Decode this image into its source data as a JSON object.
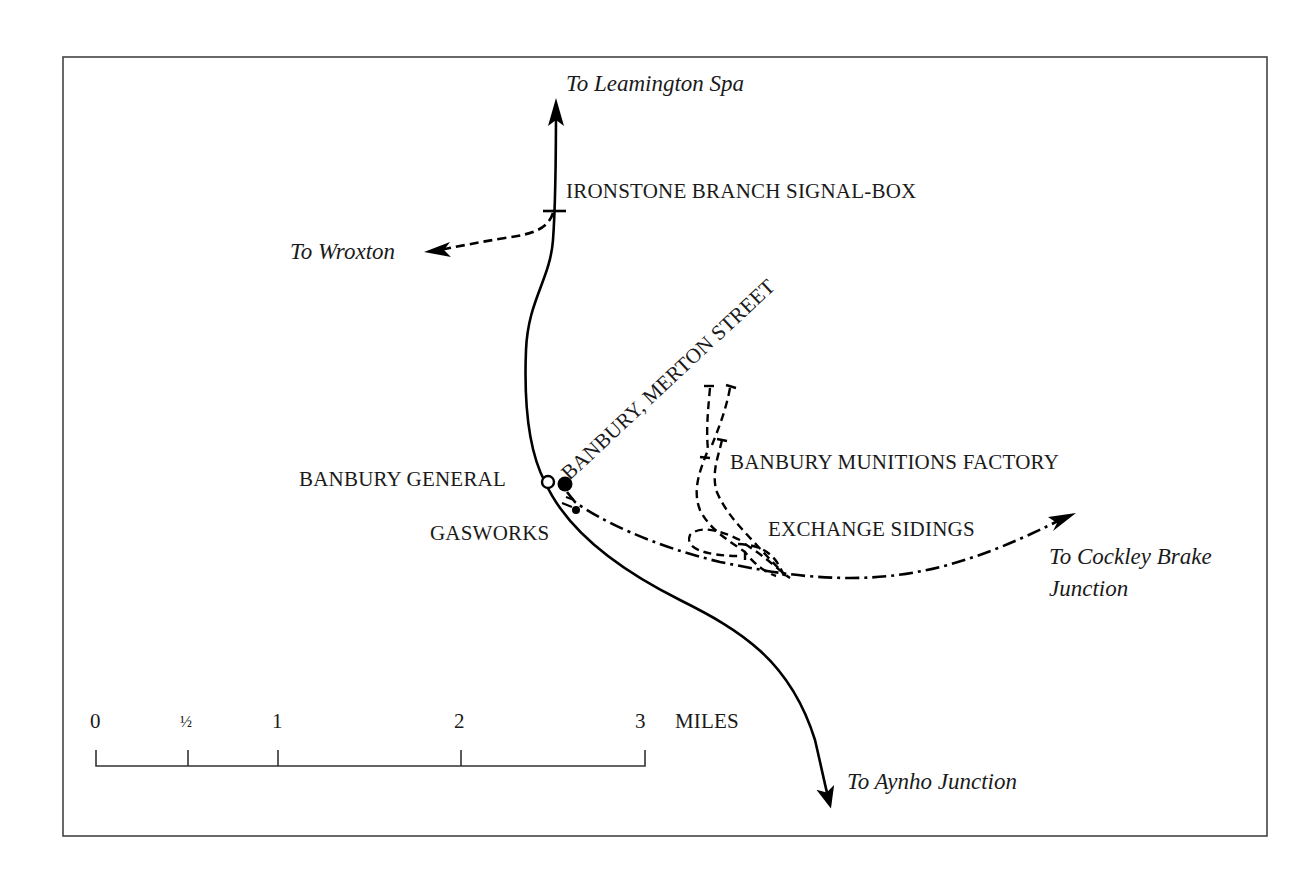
{
  "map": {
    "frame_color": "#444444",
    "line_color": "#000000",
    "labels": {
      "to_leamington": "To Leamington Spa",
      "signal_box": "IRONSTONE BRANCH SIGNAL-BOX",
      "to_wroxton": "To Wroxton",
      "merton_street": "BANBURY, MERTON STREET",
      "munitions_factory": "BANBURY MUNITIONS FACTORY",
      "banbury_general": "BANBURY GENERAL",
      "gasworks": "GASWORKS",
      "exchange_sidings": "EXCHANGE SIDINGS",
      "to_cockley_line1": "To Cockley Brake",
      "to_cockley_line2": "Junction",
      "to_aynho": "To Aynho Junction"
    },
    "scale_bar": {
      "ticks": [
        "0",
        "½",
        "1",
        "2",
        "3"
      ],
      "unit": "MILES"
    }
  }
}
